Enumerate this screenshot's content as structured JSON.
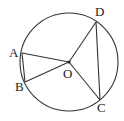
{
  "diagram": {
    "type": "circle-geometry",
    "circle": {
      "center_label": "O",
      "cx": 69,
      "cy": 62,
      "r": 49
    },
    "points": [
      {
        "id": "A",
        "label": "A",
        "x": 22,
        "y": 53,
        "label_x": 9,
        "label_y": 57
      },
      {
        "id": "B",
        "label": "B",
        "x": 25,
        "y": 82,
        "label_x": 15,
        "label_y": 91
      },
      {
        "id": "C",
        "label": "C",
        "x": 100,
        "y": 100,
        "label_x": 97,
        "label_y": 112
      },
      {
        "id": "D",
        "label": "D",
        "x": 96,
        "y": 22,
        "label_x": 95,
        "label_y": 16
      },
      {
        "id": "O",
        "label": "O",
        "x": 69,
        "y": 62,
        "label_x": 63,
        "label_y": 78
      }
    ],
    "segments": [
      [
        "A",
        "B"
      ],
      [
        "O",
        "A"
      ],
      [
        "O",
        "B"
      ],
      [
        "O",
        "C"
      ],
      [
        "O",
        "D"
      ],
      [
        "C",
        "D"
      ]
    ],
    "stroke_color": "#333333"
  }
}
